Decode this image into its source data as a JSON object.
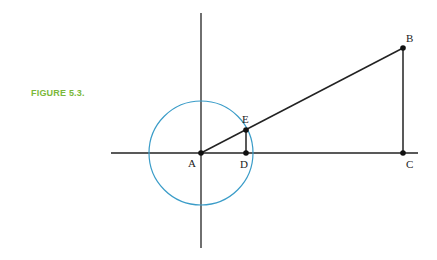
{
  "figure": {
    "label": "FIGURE 5.3.",
    "label_color": "#7ab83a",
    "circle_color": "#3a9cc8",
    "line_color": "#222222"
  },
  "points": {
    "A": {
      "label": "A"
    },
    "B": {
      "label": "B"
    },
    "C": {
      "label": "C"
    },
    "D": {
      "label": "D"
    },
    "E": {
      "label": "E"
    }
  }
}
